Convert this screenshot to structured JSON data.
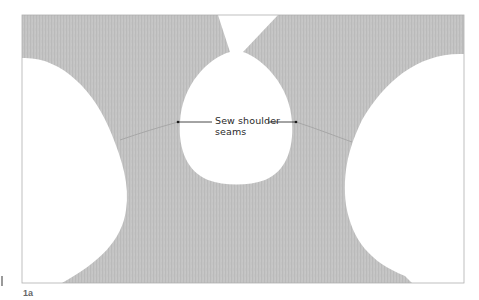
{
  "figure": {
    "label": "1a",
    "callout": {
      "text_line1": "Sew shoulder",
      "text_line2": "seams",
      "target": "shoulder seams"
    },
    "colors": {
      "fabric": "#c4c4c4",
      "fabric_rib": "#b6b6b6",
      "background": "#ffffff",
      "frame": "#a8a8a8",
      "leader_line": "#1a1a1a",
      "seam": "#9e9e9e"
    }
  }
}
